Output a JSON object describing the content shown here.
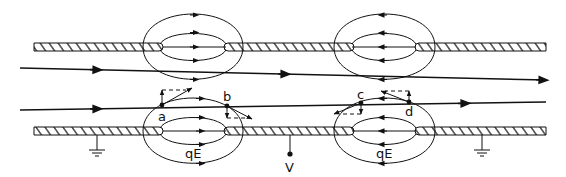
{
  "diagram": {
    "type": "electrostatic-lens-field-lines",
    "colors": {
      "ink": "#111111",
      "background": "#ffffff"
    },
    "points": [
      {
        "id": "a",
        "label": "a"
      },
      {
        "id": "b",
        "label": "b"
      },
      {
        "id": "c",
        "label": "c"
      },
      {
        "id": "d",
        "label": "d"
      }
    ],
    "force_labels": [
      {
        "id": "qE-left",
        "label": "qE"
      },
      {
        "id": "qE-right",
        "label": "qE"
      }
    ],
    "terminal": {
      "label": "V"
    },
    "grounds": [
      "ground-left",
      "ground-right"
    ],
    "lenses": [
      {
        "id": "lens-1",
        "field_direction": "right"
      },
      {
        "id": "lens-2",
        "field_direction": "left"
      }
    ],
    "rays": [
      {
        "id": "ray-upper",
        "direction": "right"
      },
      {
        "id": "ray-lower",
        "direction": "right"
      }
    ]
  }
}
